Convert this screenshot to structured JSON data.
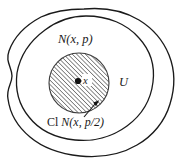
{
  "figure": {
    "type": "topology-neighborhood-diagram",
    "background_color": "#ffffff",
    "stroke_color": "#1a1a1a",
    "hatch_color": "#4a4a4a",
    "labels": {
      "outer_region": "U",
      "open_ball": "N(x, p)",
      "closed_ball_prefix": "Cl",
      "closed_ball_body": "N(x, p/2)",
      "center_point": "x"
    },
    "elements": {
      "outer_blob_name": "U",
      "inner_circle_name": "N(x, p)",
      "hatched_disc_name": "Cl N(x, p/2)",
      "center_dot_name": "x",
      "leader_arrow_target": "Cl N(x, p/2)"
    },
    "geometry": {
      "center_dot": {
        "cx": 78,
        "cy": 81,
        "r": 3.1
      },
      "hatched_disc": {
        "cx": 79,
        "cy": 83,
        "r": 30
      },
      "inner_circle": {
        "cx": 83,
        "cy": 80,
        "rx": 62,
        "ry": 67
      },
      "leader_line": {
        "x1": 84,
        "y1": 120,
        "x2": 95,
        "y2": 103
      }
    }
  }
}
